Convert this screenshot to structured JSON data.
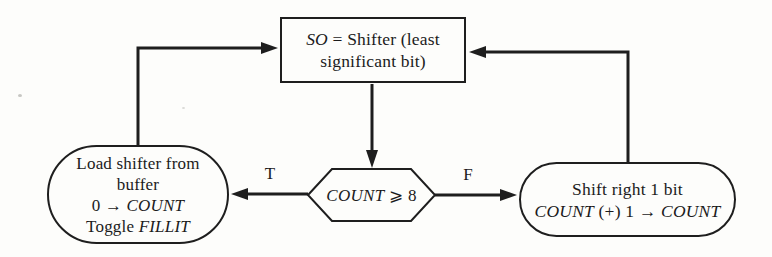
{
  "canvas": {
    "background": "#fdfdfb",
    "ink": "#1e1e1e"
  },
  "nodes": {
    "shifter_box": {
      "line1_italic": "SO",
      "line1_rest": " = Shifter (least",
      "line2": "significant bit)"
    },
    "decision_hex": {
      "italic": "COUNT",
      "rest": " ⩾ 8"
    },
    "load_stadium": {
      "line1": "Load shifter from",
      "line2": "buffer",
      "line3_pre": "0 → ",
      "line3_italic": "COUNT",
      "line4_pre": "Toggle ",
      "line4_italic": "FILLIT"
    },
    "shift_stadium": {
      "line1": "Shift right 1 bit",
      "line2_italic1": "COUNT",
      "line2_mid": " (+) 1 → ",
      "line2_italic2": "COUNT"
    }
  },
  "labels": {
    "true_branch": "T",
    "false_branch": "F"
  }
}
